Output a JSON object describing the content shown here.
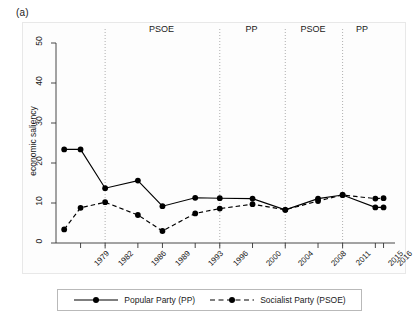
{
  "panel": {
    "label": "(a)"
  },
  "legend": {
    "items": [
      {
        "label": "Popular Party (PP)",
        "style": "solid",
        "marker": "filled-circle",
        "color": "#000000"
      },
      {
        "label": "Socialist Party (PSOE)",
        "style": "dashed",
        "marker": "filled-circle",
        "color": "#000000"
      }
    ]
  },
  "periods": [
    {
      "label": "PSOE",
      "x_center_year": 1989.0
    },
    {
      "label": "PP",
      "x_center_year": 2000.0
    },
    {
      "label": "PSOE",
      "x_center_year": 2007.5
    },
    {
      "label": "PP",
      "x_center_year": 2013.5
    }
  ],
  "dividers_years": [
    1982,
    1996,
    2004,
    2011
  ],
  "chart_data": {
    "type": "line",
    "title": "",
    "xlabel": "year",
    "ylabel": "economic saliency",
    "ylim": [
      0,
      50
    ],
    "yticks": [
      0,
      10,
      20,
      30,
      40,
      50
    ],
    "x": [
      1977,
      1979,
      1982,
      1986,
      1989,
      1993,
      1996,
      2000,
      2004,
      2008,
      2011,
      2015,
      2016
    ],
    "xtick_labels": [
      "1979",
      "1982",
      "1986",
      "1989",
      "1993",
      "1996",
      "2000",
      "2004",
      "2008",
      "2011",
      "2015",
      "2016"
    ],
    "xtick_years": [
      1979,
      1982,
      1986,
      1989,
      1993,
      1996,
      2000,
      2004,
      2008,
      2011,
      2015,
      2016
    ],
    "grid": false,
    "legend_position": "below",
    "series": [
      {
        "name": "Popular Party (PP)",
        "style": "solid",
        "color": "#000000",
        "values": [
          23.4,
          23.4,
          13.7,
          15.6,
          9.2,
          11.3,
          11.2,
          11.1,
          8.3,
          11.1,
          12.0,
          8.9,
          8.9
        ]
      },
      {
        "name": "Socialist Party (PSOE)",
        "style": "dashed",
        "color": "#000000",
        "values": [
          3.4,
          8.8,
          10.2,
          7.0,
          3.0,
          7.4,
          8.6,
          9.7,
          8.3,
          10.5,
          12.0,
          11.1,
          11.2
        ]
      }
    ]
  }
}
